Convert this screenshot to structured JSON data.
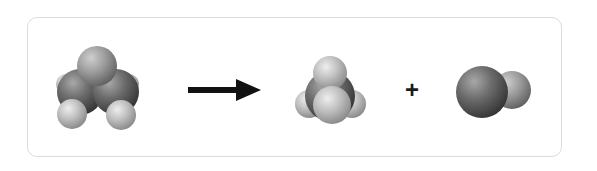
{
  "diagram": {
    "type": "chemical-reaction",
    "style": "space-filling-molecular-models",
    "reactants": [
      {
        "id": "molecule-1",
        "label": "reactant molecule (2 large + 3 small atoms)"
      }
    ],
    "arrow": {
      "label": "",
      "direction": "right"
    },
    "products": [
      {
        "id": "molecule-2",
        "label": "tetrahedral molecule (1 central + 4 small atoms)"
      },
      {
        "id": "molecule-3",
        "label": "diatomic molecule (1 large + 1 small atom)"
      }
    ],
    "operator": "+",
    "colors": {
      "border": "#dcdcdc",
      "arrow": "#111111",
      "dark_atom": "#5a5a5a",
      "light_atom": "#b8b8b8"
    }
  }
}
